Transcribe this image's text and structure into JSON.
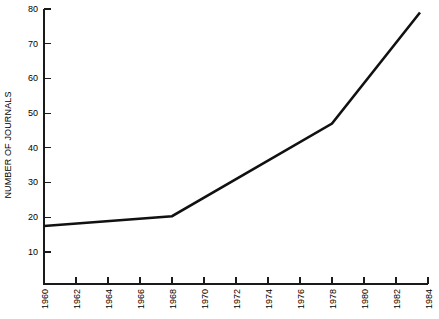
{
  "chart_data": {
    "type": "line",
    "title": "",
    "xlabel": "",
    "ylabel": "NUMBER OF JOURNALS",
    "xlim": [
      1960,
      1984
    ],
    "ylim": [
      0,
      83
    ],
    "grid": false,
    "legend": null,
    "x": [
      1960,
      1968,
      1978,
      1983.5
    ],
    "values": [
      17.5,
      20.3,
      47,
      79
    ],
    "series": [
      {
        "name": "Number of journals",
        "points": [
          {
            "x": 1960,
            "y": 17.5
          },
          {
            "x": 1968,
            "y": 20.3
          },
          {
            "x": 1978,
            "y": 47
          },
          {
            "x": 1983.5,
            "y": 79
          }
        ],
        "color": "#111111"
      }
    ],
    "x_ticks": [
      1960,
      1962,
      1964,
      1966,
      1968,
      1970,
      1972,
      1974,
      1976,
      1978,
      1980,
      1982,
      1984
    ],
    "x_tick_labels": [
      "1960",
      "1962",
      "1964",
      "1966",
      "1968",
      "1970",
      "1972",
      "1974",
      "1976",
      "1978",
      "1980",
      "1982",
      "1984"
    ],
    "y_ticks": [
      10,
      20,
      30,
      40,
      50,
      60,
      70,
      80
    ],
    "y_tick_labels": [
      "10",
      "20",
      "30",
      "40",
      "50",
      "60",
      "70",
      "80"
    ]
  },
  "axes": {
    "y_title": "NUMBER OF JOURNALS"
  }
}
